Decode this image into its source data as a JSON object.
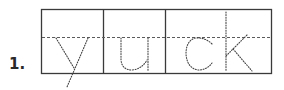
{
  "worksheet": {
    "item_number": "1.",
    "word": "yuck",
    "segments": [
      "y",
      "u",
      "ck"
    ],
    "colors": {
      "box_line": "#3a3a3a",
      "midline": "#5a5a5a",
      "tracing_dots": "#444444",
      "label": "#2a2a2a"
    }
  }
}
